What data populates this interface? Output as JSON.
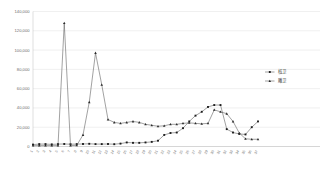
{
  "chart_data": {
    "type": "line",
    "title": "",
    "subtitle": "",
    "xlabel": "",
    "ylabel": "",
    "ylim": [
      0,
      140000
    ],
    "ytick_values": [
      0,
      20000,
      40000,
      60000,
      80000,
      100000,
      120000,
      140000
    ],
    "ytick_labels": [
      "0",
      "20,000",
      "40,000",
      "60,000",
      "80,000",
      "100,000",
      "120,000",
      "140,000"
    ],
    "grid": true,
    "legend_position": "right",
    "categories": [
      "1",
      "2",
      "3",
      "4",
      "5",
      "6",
      "7",
      "8",
      "9",
      "10",
      "11",
      "12",
      "13",
      "14",
      "15",
      "16",
      "17",
      "18",
      "19",
      "20",
      "21",
      "22",
      "23",
      "24",
      "25",
      "26",
      "27",
      "28",
      "29",
      "30",
      "31",
      "32",
      "33",
      "34",
      "35",
      "36",
      "37"
    ],
    "series": [
      {
        "name": "核卫",
        "marker": "square",
        "color": "#1d1d1d",
        "values": [
          2000,
          2500,
          2500,
          2200,
          2500,
          2600,
          2400,
          2500,
          2600,
          2800,
          2500,
          2500,
          2600,
          2400,
          3000,
          4200,
          3800,
          3800,
          4200,
          4800,
          6000,
          12000,
          14000,
          14500,
          19000,
          26000,
          32000,
          36000,
          41000,
          43000,
          43000,
          18000,
          14500,
          13000,
          12500,
          20000,
          26000
        ]
      },
      {
        "name": "雕卫",
        "marker": "triangle",
        "color": "#2a2a2a",
        "values": [
          900,
          900,
          900,
          900,
          900,
          128000,
          900,
          1200,
          12000,
          46000,
          97000,
          64000,
          28000,
          25000,
          24000,
          25000,
          26000,
          25000,
          23000,
          22000,
          21000,
          21500,
          23000,
          23000,
          24000,
          24500,
          24000,
          23500,
          24000,
          38000,
          36000,
          34000,
          26000,
          14000,
          8000,
          7500,
          7500
        ]
      }
    ]
  }
}
